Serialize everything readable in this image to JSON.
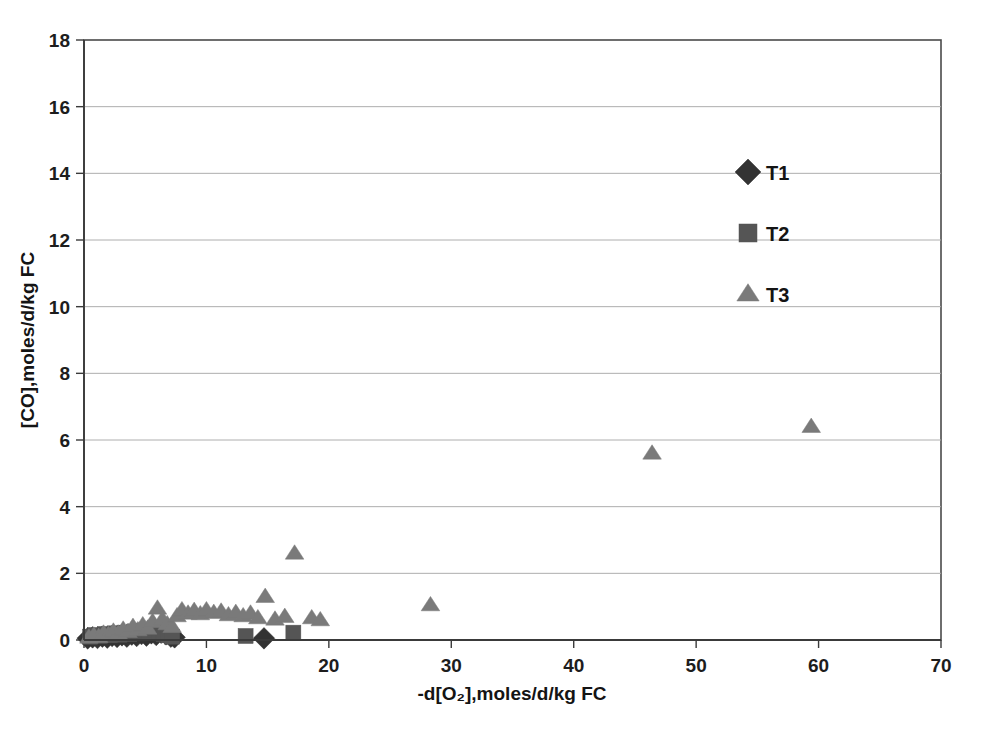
{
  "chart_data": {
    "type": "scatter",
    "title": "",
    "xlabel": "-d[O₂],moles/d/kg FC",
    "ylabel": "[CO],moles/d/kg FC",
    "xlim": [
      0,
      70
    ],
    "ylim": [
      0,
      18
    ],
    "xticks": [
      0,
      10,
      20,
      30,
      40,
      50,
      60,
      70
    ],
    "yticks": [
      0,
      2,
      4,
      6,
      8,
      10,
      12,
      14,
      16,
      18
    ],
    "xtick_labels": [
      "0",
      "10",
      "20",
      "30",
      "40",
      "50",
      "60",
      "70"
    ],
    "ytick_labels": [
      "0",
      "2",
      "4",
      "6",
      "8",
      "10",
      "12",
      "14",
      "16",
      "18"
    ],
    "grid": "horizontal",
    "legend_position": "upper right",
    "series": [
      {
        "name": "T1",
        "marker": "diamond",
        "color": "#333333",
        "points": [
          [
            0.3,
            0.05
          ],
          [
            0.7,
            0.08
          ],
          [
            1.1,
            0.06
          ],
          [
            1.5,
            0.1
          ],
          [
            1.9,
            0.07
          ],
          [
            2.3,
            0.12
          ],
          [
            2.7,
            0.09
          ],
          [
            3.1,
            0.14
          ],
          [
            3.5,
            0.1
          ],
          [
            3.9,
            0.16
          ],
          [
            4.3,
            0.12
          ],
          [
            4.7,
            0.18
          ],
          [
            5.1,
            0.13
          ],
          [
            5.5,
            0.2
          ],
          [
            5.9,
            0.15
          ],
          [
            6.3,
            0.22
          ],
          [
            6.7,
            0.17
          ],
          [
            7.1,
            0.1
          ],
          [
            7.4,
            0.08
          ],
          [
            14.7,
            0.05
          ]
        ]
      },
      {
        "name": "T2",
        "marker": "square",
        "color": "#555555",
        "points": [
          [
            0.5,
            0.1
          ],
          [
            0.9,
            0.15
          ],
          [
            1.3,
            0.12
          ],
          [
            1.7,
            0.18
          ],
          [
            2.1,
            0.14
          ],
          [
            2.5,
            0.2
          ],
          [
            2.9,
            0.16
          ],
          [
            3.3,
            0.22
          ],
          [
            3.7,
            0.18
          ],
          [
            4.1,
            0.25
          ],
          [
            4.5,
            0.2
          ],
          [
            4.9,
            0.28
          ],
          [
            5.3,
            0.22
          ],
          [
            5.7,
            0.3
          ],
          [
            6.1,
            0.24
          ],
          [
            6.5,
            0.18
          ],
          [
            6.9,
            0.14
          ],
          [
            7.2,
            0.1
          ],
          [
            13.2,
            0.12
          ],
          [
            17.1,
            0.22
          ]
        ]
      },
      {
        "name": "T3",
        "marker": "triangle",
        "color": "#7a7a7a",
        "points": [
          [
            0.4,
            0.08
          ],
          [
            0.8,
            0.14
          ],
          [
            1.2,
            0.1
          ],
          [
            1.6,
            0.2
          ],
          [
            2.0,
            0.16
          ],
          [
            2.4,
            0.26
          ],
          [
            2.8,
            0.2
          ],
          [
            3.2,
            0.32
          ],
          [
            3.6,
            0.25
          ],
          [
            4.0,
            0.4
          ],
          [
            4.4,
            0.3
          ],
          [
            4.8,
            0.45
          ],
          [
            5.2,
            0.35
          ],
          [
            5.6,
            0.55
          ],
          [
            6.0,
            0.95
          ],
          [
            6.4,
            0.62
          ],
          [
            6.8,
            0.48
          ],
          [
            7.2,
            0.4
          ],
          [
            7.6,
            0.72
          ],
          [
            8.0,
            0.9
          ],
          [
            8.5,
            0.8
          ],
          [
            9.0,
            0.88
          ],
          [
            9.5,
            0.78
          ],
          [
            10.0,
            0.9
          ],
          [
            10.6,
            0.82
          ],
          [
            11.2,
            0.86
          ],
          [
            11.8,
            0.75
          ],
          [
            12.4,
            0.82
          ],
          [
            13.0,
            0.72
          ],
          [
            13.6,
            0.8
          ],
          [
            14.2,
            0.66
          ],
          [
            14.8,
            1.3
          ],
          [
            15.6,
            0.62
          ],
          [
            16.4,
            0.7
          ],
          [
            17.2,
            2.6
          ],
          [
            18.6,
            0.66
          ],
          [
            19.3,
            0.6
          ],
          [
            28.3,
            1.05
          ],
          [
            46.4,
            5.6
          ],
          [
            59.4,
            6.4
          ]
        ]
      }
    ]
  },
  "legend": {
    "entries": [
      {
        "label": "T1"
      },
      {
        "label": "T2"
      },
      {
        "label": "T3"
      }
    ]
  }
}
